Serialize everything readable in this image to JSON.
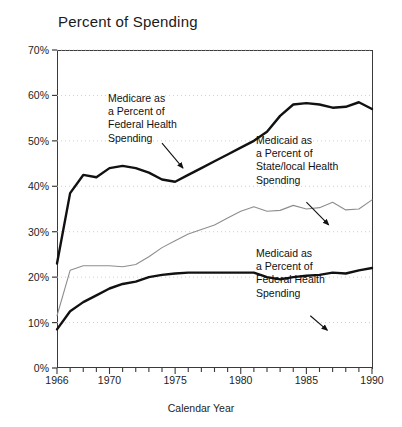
{
  "chart_data": {
    "type": "line",
    "title": "Percent of Spending",
    "xlabel": "Calendar Year",
    "ylabel": "",
    "xlim": [
      1966,
      1990
    ],
    "ylim": [
      0,
      70
    ],
    "grid": "horizontal-dotted",
    "legend_position": "inline-annotations",
    "x": [
      1966,
      1967,
      1968,
      1969,
      1970,
      1971,
      1972,
      1973,
      1974,
      1975,
      1976,
      1977,
      1978,
      1979,
      1980,
      1981,
      1982,
      1983,
      1984,
      1985,
      1986,
      1987,
      1988,
      1989,
      1990
    ],
    "y_ticks": [
      "0%",
      "10%",
      "20%",
      "30%",
      "40%",
      "50%",
      "60%",
      "70%"
    ],
    "y_tick_values": [
      0,
      10,
      20,
      30,
      40,
      50,
      60,
      70
    ],
    "x_ticks": [
      "1966",
      "1970",
      "1975",
      "1980",
      "1985",
      "1990"
    ],
    "x_tick_values": [
      1966,
      1970,
      1975,
      1980,
      1985,
      1990
    ],
    "series": [
      {
        "name": "Medicare as a Percent of Federal Health Spending",
        "style": "bold-black",
        "color": "#111111",
        "values": [
          23.0,
          38.5,
          42.5,
          42.0,
          44.0,
          44.5,
          44.0,
          43.0,
          41.5,
          41.0,
          42.5,
          44.0,
          45.5,
          47.0,
          48.5,
          50.0,
          52.0,
          55.5,
          58.0,
          58.3,
          58.0,
          57.3,
          57.5,
          58.5,
          57.0
        ]
      },
      {
        "name": "Medicaid as a Percent of State/local Health Spending",
        "style": "thin-gray",
        "color": "#8e8e8e",
        "values": [
          11.5,
          21.5,
          22.5,
          22.5,
          22.5,
          22.3,
          22.8,
          24.5,
          26.5,
          28.0,
          29.5,
          30.5,
          31.5,
          33.0,
          34.5,
          35.5,
          34.5,
          34.7,
          35.8,
          35.0,
          35.3,
          36.5,
          34.8,
          35.0,
          37.0
        ]
      },
      {
        "name": "Medicaid as a Percent of Federal Health Spending",
        "style": "bold-black",
        "color": "#111111",
        "values": [
          8.5,
          12.5,
          14.5,
          16.0,
          17.5,
          18.5,
          19.0,
          20.0,
          20.5,
          20.8,
          21.0,
          21.0,
          21.0,
          21.0,
          21.0,
          21.0,
          20.0,
          19.5,
          20.0,
          20.3,
          20.5,
          21.0,
          20.8,
          21.5,
          22.0
        ]
      }
    ],
    "annotations": [
      {
        "id": "medicare-label",
        "text": "Medicare as\na Percent of\nFederal Health\nSpending",
        "arrow_from": [
          1974.0,
          49.5
        ],
        "arrow_to": [
          1975.6,
          44.0
        ]
      },
      {
        "id": "medicaid-statelocal-label",
        "text": "Medicaid as\na Percent of\nState/local Health\nSpending",
        "arrow_from": [
          1985.0,
          36.5
        ],
        "arrow_to": [
          1986.7,
          31.5
        ]
      },
      {
        "id": "medicaid-federal-label",
        "text": "Medicaid as\na Percent of\nFederal Health\nSpending",
        "arrow_from": [
          1985.3,
          11.5
        ],
        "arrow_to": [
          1986.6,
          8.3
        ]
      }
    ],
    "colors": {
      "axis": "#3a3a3a",
      "grid": "#c8c8c8",
      "bold_line": "#111111",
      "gray_line": "#8e8e8e",
      "text": "#1d1d1d",
      "background": "#ffffff"
    }
  }
}
